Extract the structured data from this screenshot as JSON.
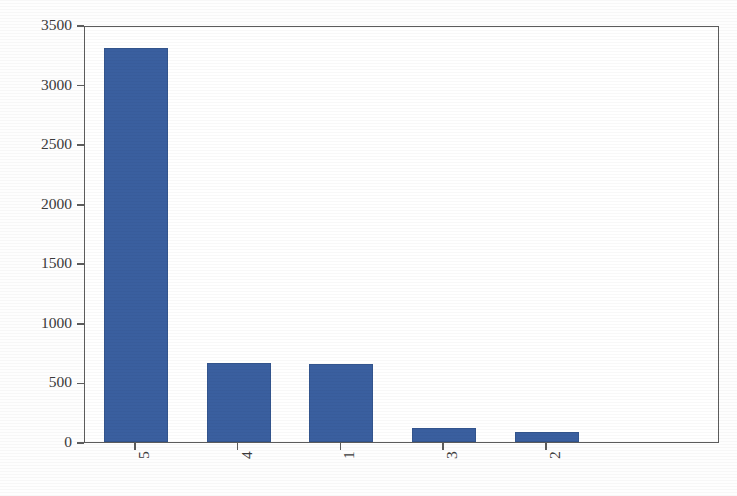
{
  "chart_data": {
    "type": "bar",
    "title": "",
    "xlabel": "",
    "ylabel": "",
    "categories": [
      "5",
      "4",
      "1",
      "3",
      "2"
    ],
    "values": [
      3400,
      680,
      670,
      125,
      85
    ],
    "ylim": [
      0,
      3600
    ],
    "yticks": [
      0,
      500,
      1000,
      1500,
      2000,
      2500,
      3000,
      3500
    ],
    "ytick_labels": [
      "0",
      "500",
      "1000",
      "1500",
      "2000",
      "2500",
      "3000",
      "3500"
    ],
    "xtick_labels": [
      "5",
      "4",
      "1",
      "3",
      "2"
    ],
    "xtick_rotation": 90,
    "grid": false,
    "legend": null,
    "bar_color": "#3a5f9f",
    "axis_color": "#5c5c5c",
    "background_color": "#ffffff",
    "series": [
      {
        "name": "count",
        "values": [
          3400,
          680,
          670,
          125,
          85
        ]
      }
    ]
  },
  "figure": {
    "title_fragment": "",
    "width": 737,
    "height": 496
  }
}
